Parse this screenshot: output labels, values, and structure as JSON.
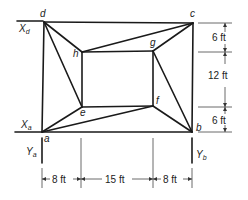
{
  "diagram": {
    "type": "truss/frame structure",
    "nodes": {
      "a": {
        "label": "a",
        "x": 42,
        "y": 132
      },
      "b": {
        "label": "b",
        "x": 192,
        "y": 132
      },
      "c": {
        "label": "c",
        "x": 193,
        "y": 23
      },
      "d": {
        "label": "d",
        "x": 44,
        "y": 22
      },
      "e": {
        "label": "e",
        "x": 82,
        "y": 107
      },
      "f": {
        "label": "f",
        "x": 153,
        "y": 106
      },
      "g": {
        "label": "g",
        "x": 153,
        "y": 51
      },
      "h": {
        "label": "h",
        "x": 82,
        "y": 52
      }
    },
    "members": [
      [
        "a",
        "b"
      ],
      [
        "b",
        "c"
      ],
      [
        "c",
        "d"
      ],
      [
        "d",
        "a"
      ],
      [
        "h",
        "g"
      ],
      [
        "g",
        "f"
      ],
      [
        "f",
        "e"
      ],
      [
        "e",
        "h"
      ],
      [
        "d",
        "h"
      ],
      [
        "d",
        "e"
      ],
      [
        "c",
        "h"
      ],
      [
        "c",
        "g"
      ],
      [
        "b",
        "g"
      ],
      [
        "b",
        "f"
      ],
      [
        "a",
        "e"
      ],
      [
        "a",
        "f"
      ]
    ],
    "reactions": {
      "Xd": {
        "label": "X",
        "sub": "d"
      },
      "Xa": {
        "label": "X",
        "sub": "a"
      },
      "Ya": {
        "label": "Y",
        "sub": "a"
      },
      "Yb": {
        "label": "Y",
        "sub": "b"
      }
    },
    "dimensions": {
      "vertical": [
        "6 ft",
        "12 ft",
        "6 ft"
      ],
      "horizontal": [
        "8 ft",
        "15 ft",
        "8 ft"
      ]
    }
  }
}
